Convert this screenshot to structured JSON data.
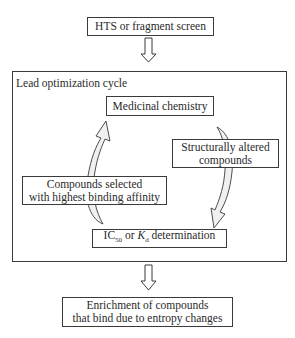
{
  "diagram": {
    "top_box": {
      "label": "HTS or fragment screen"
    },
    "cycle": {
      "title": "Lead optimization cycle",
      "medicinal_chemistry": {
        "label": "Medicinal chemistry"
      },
      "structurally_altered": {
        "line1": "Structurally altered",
        "line2": "compounds"
      },
      "compounds_selected": {
        "line1": "Compounds selected",
        "line2": "with highest binding affinity"
      },
      "determination": {
        "ic": "IC",
        "ic_sub": "50",
        "or": " or ",
        "k": "K",
        "k_sub": "d",
        "rest": " determination"
      }
    },
    "bottom_box": {
      "line1": "Enrichment of compounds",
      "line2": "that bind due to entropy changes"
    },
    "colors": {
      "line": "#3a3a3a",
      "arrow_fill": "#f0f0f0"
    }
  }
}
